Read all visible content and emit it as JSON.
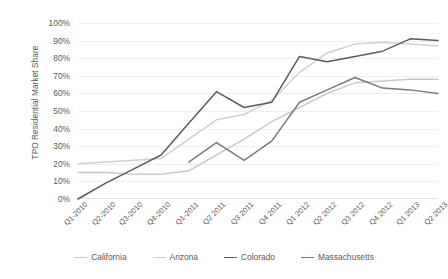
{
  "chart_data": {
    "type": "line",
    "title": "",
    "xlabel": "",
    "ylabel": "TPO Residential Market Share",
    "ylim": [
      0,
      100
    ],
    "ytick_labels": [
      "100%",
      "90%",
      "80%",
      "70%",
      "60%",
      "50%",
      "40%",
      "30%",
      "20%",
      "10%",
      "0%"
    ],
    "ytick_values": [
      100,
      90,
      80,
      70,
      60,
      50,
      40,
      30,
      20,
      10,
      0
    ],
    "grid": "horizontal",
    "legend_position": "bottom",
    "categories": [
      "Q1-2010",
      "Q2-2010",
      "Q3-2010",
      "Q4-2010",
      "Q1-2011",
      "Q2 2011",
      "Q3 2011",
      "Q4 2011",
      "Q1 2012",
      "Q2 2012",
      "Q3 2012",
      "Q4 2012",
      "Q1 2013",
      "Q2 2013"
    ],
    "series": [
      {
        "name": "California",
        "color": "#c9c9c9",
        "values": [
          15,
          15,
          14,
          14,
          16,
          25,
          34,
          44,
          52,
          60,
          66,
          67,
          68,
          68
        ]
      },
      {
        "name": "Arizona",
        "color": "#d0d0d0",
        "values": [
          20,
          21,
          22,
          23,
          34,
          45,
          48,
          56,
          72,
          83,
          88,
          89,
          88,
          87
        ]
      },
      {
        "name": "Colorado",
        "color": "#5c5c5c",
        "values": [
          0,
          9,
          17,
          25,
          43,
          61,
          52,
          55,
          81,
          78,
          81,
          84,
          91,
          90
        ]
      },
      {
        "name": "Massachusetts",
        "color": "#7a7a7a",
        "values": [
          null,
          null,
          null,
          null,
          21,
          32,
          22,
          33,
          55,
          62,
          69,
          63,
          62,
          60
        ]
      }
    ]
  },
  "legend": {
    "items": [
      {
        "label": "California",
        "color": "#c9c9c9"
      },
      {
        "label": "Arizona",
        "color": "#d0d0d0"
      },
      {
        "label": "Colorado",
        "color": "#5c5c5c"
      },
      {
        "label": "Massachusetts",
        "color": "#7a7a7a"
      }
    ]
  }
}
